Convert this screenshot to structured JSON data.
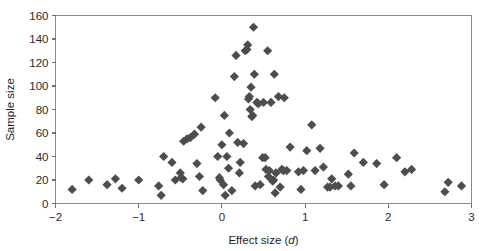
{
  "chart_data": {
    "type": "scatter",
    "title": "",
    "xlabel": "Effect size (d)",
    "xlabel_plain": "Effect size (",
    "xlabel_italic": "d",
    "xlabel_tail": ")",
    "ylabel": "Sample size",
    "xlim": [
      -2,
      3
    ],
    "ylim": [
      0,
      160
    ],
    "xticks": [
      -2,
      -1,
      0,
      1,
      2,
      3
    ],
    "xticklabels": [
      "−2",
      "−1",
      "0",
      "1",
      "2",
      "3"
    ],
    "yticks": [
      0,
      20,
      40,
      60,
      80,
      100,
      120,
      140,
      160
    ],
    "yticklabels": [
      "0",
      "20",
      "40",
      "60",
      "80",
      "100",
      "120",
      "140",
      "160"
    ],
    "grid": false,
    "legend": false,
    "marker": "diamond",
    "marker_color": "#4d4d4d",
    "marker_size": 4.6,
    "frame": "box",
    "series": [
      {
        "name": "studies",
        "points": [
          [
            -1.8,
            12
          ],
          [
            -1.6,
            20
          ],
          [
            -1.38,
            16
          ],
          [
            -1.28,
            21
          ],
          [
            -1.2,
            13
          ],
          [
            -1.0,
            20
          ],
          [
            -0.76,
            15
          ],
          [
            -0.73,
            7
          ],
          [
            -0.7,
            40
          ],
          [
            -0.6,
            35
          ],
          [
            -0.56,
            20
          ],
          [
            -0.5,
            26
          ],
          [
            -0.49,
            22
          ],
          [
            -0.47,
            21
          ],
          [
            -0.46,
            53
          ],
          [
            -0.42,
            55
          ],
          [
            -0.38,
            56
          ],
          [
            -0.33,
            59
          ],
          [
            -0.3,
            34
          ],
          [
            -0.27,
            23
          ],
          [
            -0.25,
            65
          ],
          [
            -0.23,
            11
          ],
          [
            -0.08,
            90
          ],
          [
            -0.05,
            40
          ],
          [
            -0.03,
            22
          ],
          [
            -0.02,
            20
          ],
          [
            0.0,
            50
          ],
          [
            0.02,
            16
          ],
          [
            0.03,
            75
          ],
          [
            0.04,
            7
          ],
          [
            0.06,
            40
          ],
          [
            0.08,
            30
          ],
          [
            0.09,
            60
          ],
          [
            0.12,
            11
          ],
          [
            0.15,
            108
          ],
          [
            0.17,
            126
          ],
          [
            0.19,
            52
          ],
          [
            0.21,
            26
          ],
          [
            0.22,
            35
          ],
          [
            0.26,
            51
          ],
          [
            0.28,
            130
          ],
          [
            0.3,
            131
          ],
          [
            0.31,
            135
          ],
          [
            0.32,
            89
          ],
          [
            0.33,
            91
          ],
          [
            0.34,
            80
          ],
          [
            0.35,
            99
          ],
          [
            0.36,
            74
          ],
          [
            0.37,
            75
          ],
          [
            0.38,
            150
          ],
          [
            0.39,
            110
          ],
          [
            0.4,
            15
          ],
          [
            0.42,
            86
          ],
          [
            0.44,
            85
          ],
          [
            0.46,
            16
          ],
          [
            0.49,
            39
          ],
          [
            0.5,
            86
          ],
          [
            0.52,
            39
          ],
          [
            0.53,
            29
          ],
          [
            0.55,
            130
          ],
          [
            0.56,
            23
          ],
          [
            0.57,
            28
          ],
          [
            0.59,
            86
          ],
          [
            0.61,
            19
          ],
          [
            0.62,
            20
          ],
          [
            0.63,
            110
          ],
          [
            0.64,
            9
          ],
          [
            0.65,
            26
          ],
          [
            0.68,
            91
          ],
          [
            0.7,
            14
          ],
          [
            0.72,
            29
          ],
          [
            0.74,
            28
          ],
          [
            0.75,
            90
          ],
          [
            0.78,
            28
          ],
          [
            0.82,
            48
          ],
          [
            0.92,
            27
          ],
          [
            0.95,
            12
          ],
          [
            0.98,
            28
          ],
          [
            1.02,
            45
          ],
          [
            1.08,
            67
          ],
          [
            1.12,
            28
          ],
          [
            1.18,
            47
          ],
          [
            1.22,
            31
          ],
          [
            1.27,
            14
          ],
          [
            1.3,
            14
          ],
          [
            1.32,
            21
          ],
          [
            1.36,
            15
          ],
          [
            1.4,
            15
          ],
          [
            1.52,
            25
          ],
          [
            1.55,
            15
          ],
          [
            1.59,
            43
          ],
          [
            1.7,
            35
          ],
          [
            1.86,
            34
          ],
          [
            1.95,
            16
          ],
          [
            2.1,
            39
          ],
          [
            2.2,
            27
          ],
          [
            2.28,
            29
          ],
          [
            2.68,
            10
          ],
          [
            2.72,
            18
          ],
          [
            2.88,
            15
          ]
        ]
      }
    ]
  }
}
